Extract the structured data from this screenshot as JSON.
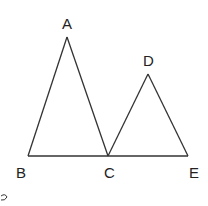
{
  "diagram": {
    "stroke_color": "#333333",
    "points": {
      "A": {
        "label": "A",
        "x": 67,
        "y": 37
      },
      "B": {
        "label": "B",
        "x": 28,
        "y": 156
      },
      "C": {
        "label": "C",
        "x": 108,
        "y": 156
      },
      "D": {
        "label": "D",
        "x": 148,
        "y": 74
      },
      "E": {
        "label": "E",
        "x": 188,
        "y": 156
      }
    },
    "triangles": [
      [
        "A",
        "B",
        "C"
      ],
      [
        "D",
        "C",
        "E"
      ]
    ],
    "segments": [
      [
        "B",
        "E"
      ]
    ]
  }
}
